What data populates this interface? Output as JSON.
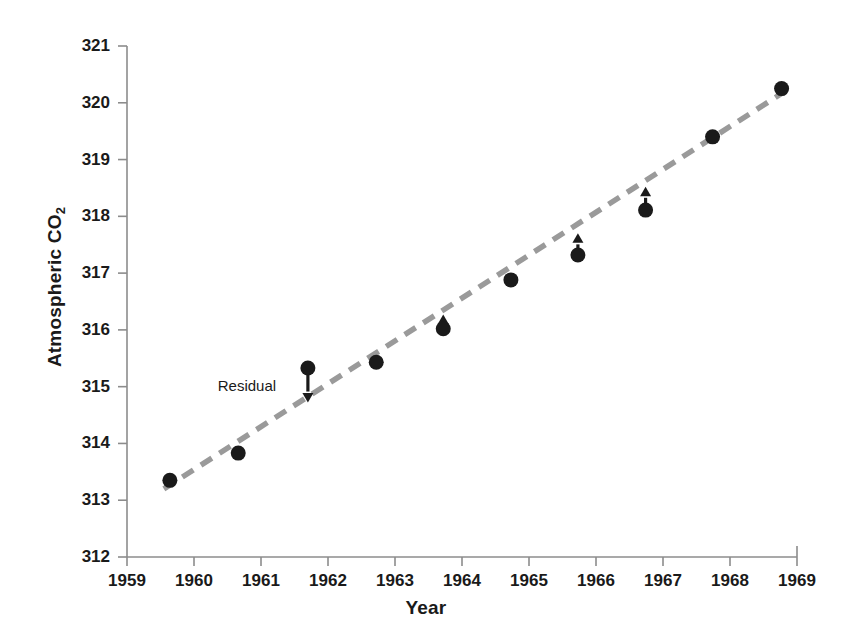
{
  "chart_data": {
    "type": "scatter",
    "title": "",
    "xlabel": "Year",
    "ylabel_text": "Atmospheric CO",
    "ylabel_sub": "2",
    "ylabel_full": "Atmospheric CO2",
    "xlim": [
      1959,
      1969
    ],
    "ylim": [
      312,
      321
    ],
    "xticks": [
      "1959",
      "1960",
      "1961",
      "1962",
      "1963",
      "1964",
      "1965",
      "1966",
      "1967",
      "1968",
      "1969"
    ],
    "xtick_values": [
      1959,
      1960,
      1961,
      1962,
      1963,
      1964,
      1965,
      1966,
      1967,
      1968,
      1969
    ],
    "yticks": [
      "312",
      "313",
      "314",
      "315",
      "316",
      "317",
      "318",
      "319",
      "320",
      "321"
    ],
    "ytick_values": [
      312,
      313,
      314,
      315,
      316,
      317,
      318,
      319,
      320,
      321
    ],
    "grid": false,
    "legend": "none",
    "marker_color": "#1a1a1a",
    "trendline_color": "#9a9a9a",
    "axis_color": "#8c8c8c",
    "series": [
      {
        "name": "Atmospheric CO2 observations",
        "x": [
          1959.64,
          1960.66,
          1961.7,
          1962.72,
          1963.72,
          1964.73,
          1965.73,
          1966.74,
          1967.74,
          1968.77
        ],
        "y": [
          313.35,
          313.83,
          315.33,
          315.43,
          316.02,
          316.88,
          317.32,
          318.11,
          319.4,
          320.25
        ]
      }
    ],
    "trendline": {
      "name": "least-squares fit",
      "x": [
        1959.55,
        1968.95
      ],
      "y": [
        313.2,
        320.3
      ],
      "style": "dashed"
    },
    "annotations": [
      {
        "label": "Residual",
        "label_x": 1961.22,
        "label_y": 315.0,
        "arrow_x": 1961.7,
        "arrow_y_from": 315.33,
        "arrow_y_to": 314.72,
        "direction": "down"
      },
      {
        "label": "",
        "arrow_x": 1963.72,
        "arrow_y_from": 316.02,
        "arrow_y_to": 316.27,
        "direction": "up"
      },
      {
        "label": "",
        "arrow_x": 1965.73,
        "arrow_y_from": 317.32,
        "arrow_y_to": 317.7,
        "direction": "up"
      },
      {
        "label": "",
        "arrow_x": 1966.74,
        "arrow_y_from": 318.11,
        "arrow_y_to": 318.52,
        "direction": "up"
      }
    ]
  }
}
